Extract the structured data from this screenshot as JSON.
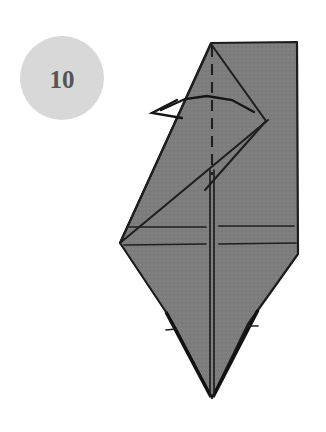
{
  "diagram": {
    "type": "origami-fold-instruction",
    "step_badge": {
      "label": "10",
      "shape": "circle",
      "fill_color": "#d8d8d8",
      "text_color": "#555555",
      "center": [
        62,
        78
      ],
      "radius": 42
    },
    "canvas": {
      "width": 326,
      "height": 432,
      "background_color": "#ffffff"
    },
    "paper": {
      "name": "folded-paper-model",
      "fill_color": "#7d7d7d",
      "outline_color": "#1c1c1c",
      "outline_points": "211,43 297,42 298,254 258,310 248,324 212,398 175,327 166,312 120,243"
    },
    "creases": [
      {
        "name": "center-fold-dashed",
        "style": "dashed",
        "points": "212,46 212,175"
      },
      {
        "name": "center-fold-solid-left",
        "style": "solid-thin",
        "points": "210,170 210,396"
      },
      {
        "name": "center-fold-solid-right",
        "style": "solid-thin",
        "points": "214,170 214,396"
      },
      {
        "name": "upper-right-v-upper",
        "style": "solid",
        "points": "211,44 266,121"
      },
      {
        "name": "upper-right-v-lower",
        "style": "solid",
        "points": "266,121 205,190"
      },
      {
        "name": "long-diagonal-crease",
        "style": "solid",
        "points": "120,243 268,120"
      },
      {
        "name": "left-slant-edge-crease",
        "style": "solid",
        "points": "211,44 120,243"
      },
      {
        "name": "horizontal-crease-upper-left",
        "style": "thin",
        "points": "127,227 206,227"
      },
      {
        "name": "horizontal-crease-upper-right",
        "style": "thin",
        "points": "219,226 294,226"
      },
      {
        "name": "horizontal-crease-lower-left",
        "style": "thin",
        "points": "124,245 206,244"
      },
      {
        "name": "horizontal-crease-lower-right",
        "style": "thin",
        "points": "219,244 296,243"
      },
      {
        "name": "left-lower-edge-notch",
        "style": "thin",
        "points": "166,330 176,329"
      },
      {
        "name": "right-lower-edge-notch",
        "style": "thin",
        "points": "248,326 258,326"
      }
    ],
    "fold_arrow": {
      "name": "fold-direction-arrow",
      "direction": "left",
      "shaft_points": "254,112 232,100 207,96 185,99 161,110",
      "head_points": "177,100 152,113 182,118",
      "color": "#151515"
    }
  }
}
